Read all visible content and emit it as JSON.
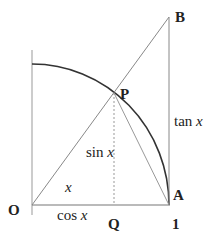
{
  "diagram": {
    "points": {
      "O": {
        "label": "O"
      },
      "P": {
        "label": "P"
      },
      "Q": {
        "label": "Q"
      },
      "A": {
        "label": "A"
      },
      "B": {
        "label": "B"
      },
      "one": {
        "label": "1"
      }
    },
    "segment_labels": {
      "sin": {
        "fn": "sin",
        "var": "x"
      },
      "cos": {
        "fn": "cos",
        "var": "x"
      },
      "tan": {
        "fn": "tan",
        "var": "x"
      },
      "angle": {
        "var": "x"
      }
    },
    "colors": {
      "line": "#888888",
      "arc": "#333333",
      "text": "#222222"
    }
  }
}
